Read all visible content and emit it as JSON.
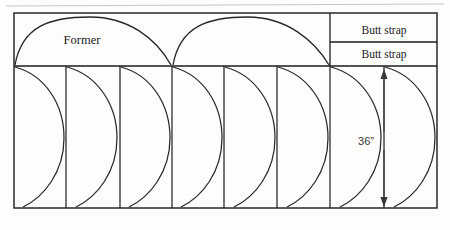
{
  "figure": {
    "kind": "technical-nesting-layout",
    "background_color": "#fdfdfc",
    "line_color": "#1d1b19",
    "curve_color": "#2a2724",
    "frame": {
      "x": 14,
      "y": 13,
      "width": 423,
      "height": 195
    },
    "band_divider_y": 66,
    "strap_divider_y": 42
  },
  "labels": {
    "former_1": "Former",
    "butt_strap_top": "Butt strap",
    "butt_strap_bottom": "Butt strap",
    "dimension_36": "36”"
  },
  "label_positions": {
    "former_1": {
      "x": 82,
      "y": 44
    },
    "butt_strap_top": {
      "x": 384,
      "y": 34
    },
    "butt_strap_bottom": {
      "x": 384,
      "y": 58
    },
    "dimension_36": {
      "x": 364,
      "y": 142
    }
  },
  "upper_band": {
    "y_top": 13,
    "y_bottom": 66,
    "formers": [
      {
        "name": "former-arc-left",
        "start_x": 14,
        "apex_x": 88,
        "end_x": 172
      },
      {
        "name": "former-arc-right",
        "start_x": 172,
        "apex_x": 246,
        "end_x": 330
      }
    ],
    "strap_box": {
      "x_left": 330,
      "x_right": 437,
      "split_y": 42
    }
  },
  "lower_band": {
    "y_top": 66,
    "y_bottom": 208,
    "dividers_x": [
      14,
      66,
      120,
      172,
      224,
      277,
      330,
      384,
      437
    ],
    "cells": [
      {
        "name": "cell-1",
        "x_left": 14,
        "x_right": 66
      },
      {
        "name": "cell-2",
        "x_left": 66,
        "x_right": 120
      },
      {
        "name": "cell-3",
        "x_left": 120,
        "x_right": 172
      },
      {
        "name": "cell-4",
        "x_left": 172,
        "x_right": 224
      },
      {
        "name": "cell-5",
        "x_left": 224,
        "x_right": 277
      },
      {
        "name": "cell-6",
        "x_left": 277,
        "x_right": 330
      },
      {
        "name": "cell-7",
        "x_left": 330,
        "x_right": 384
      },
      {
        "name": "cell-8",
        "x_left": 384,
        "x_right": 437
      }
    ]
  },
  "dimension": {
    "name": "vertical-dimension-36",
    "x": 384,
    "y_top": 69,
    "y_bottom": 207,
    "value": "36”"
  },
  "colors": {
    "ink": "#1d1b19",
    "curve": "#2a2724",
    "text": "#24221f",
    "paper": "#fdfdfc"
  }
}
